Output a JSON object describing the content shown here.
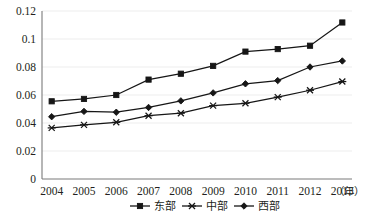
{
  "chart_data": {
    "type": "line",
    "title": "",
    "subtitle": "",
    "xlabel": "年",
    "ylabel": "",
    "categories": [
      "2004",
      "2005",
      "2006",
      "2007",
      "2008",
      "2009",
      "2010",
      "2011",
      "2012",
      "2013"
    ],
    "x": [
      2004,
      2005,
      2006,
      2007,
      2008,
      2009,
      2010,
      2011,
      2012,
      2013
    ],
    "ylim": [
      0,
      0.12
    ],
    "yticks": [
      0,
      0.02,
      0.04,
      0.06,
      0.08,
      0.1,
      0.12
    ],
    "ytick_labels": [
      "0",
      "0.02",
      "0.04",
      "0.06",
      "0.08",
      "0.1",
      "0.12"
    ],
    "grid": true,
    "grid_axis": "y",
    "legend_position": "bottom",
    "series": [
      {
        "name": "东部",
        "marker": "square",
        "color": "#161616",
        "values": [
          0.0555,
          0.0572,
          0.06,
          0.071,
          0.0752,
          0.0808,
          0.091,
          0.0928,
          0.0952,
          0.1118
        ]
      },
      {
        "name": "中部",
        "marker": "cross",
        "color": "#161616",
        "values": [
          0.0365,
          0.0387,
          0.0405,
          0.0452,
          0.047,
          0.0524,
          0.0541,
          0.0585,
          0.0634,
          0.0696
        ]
      },
      {
        "name": "西部",
        "marker": "diamond",
        "color": "#161616",
        "values": [
          0.0445,
          0.0483,
          0.0477,
          0.0511,
          0.0558,
          0.0615,
          0.068,
          0.0703,
          0.08,
          0.0843
        ]
      }
    ]
  },
  "axis": {
    "y_labels": [
      "0.12",
      "0.1",
      "0.08",
      "0.06",
      "0.04",
      "0.02",
      "0"
    ],
    "x_labels": [
      "2004",
      "2005",
      "2006",
      "2007",
      "2008",
      "2009",
      "2010",
      "2011",
      "2012",
      "2013"
    ],
    "x_unit": "（年）"
  },
  "legend": {
    "items": [
      {
        "label": "东部",
        "marker": "square"
      },
      {
        "label": "中部",
        "marker": "cross"
      },
      {
        "label": "西部",
        "marker": "diamond"
      }
    ]
  },
  "colors": {
    "series": "#161616",
    "grid": "#e9e9e9",
    "axis": "#7a7a7a",
    "text": "#231f20",
    "background": "#ffffff"
  }
}
